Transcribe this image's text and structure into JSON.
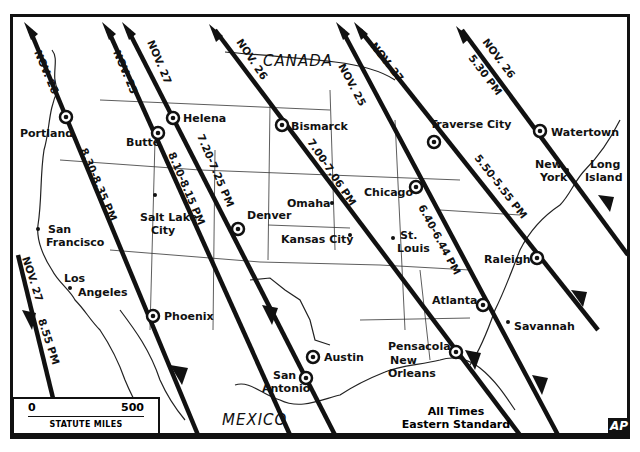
{
  "map": {
    "regions": {
      "canada": "CANADA",
      "mexico": "MEXICO"
    },
    "paths": [
      {
        "id": "nov26-west",
        "date_label": "NOV. 26",
        "time_label": "8.30-8.35 PM",
        "cities": [
          "Portland",
          "Phoenix"
        ]
      },
      {
        "id": "nov25-west",
        "date_label": "NOV. 25",
        "time_label": "8.10-8.15 PM",
        "cities": [
          "Butte",
          "San Antonio"
        ]
      },
      {
        "id": "nov27-west",
        "date_label": "NOV. 27",
        "time_label": "7.20-7.25 PM",
        "cities": [
          "Helena",
          "Denver",
          "Austin"
        ]
      },
      {
        "id": "nov26-central",
        "date_label": "NOV. 26",
        "time_label": "7.00-7.06 PM",
        "cities": [
          "Bismarck",
          "Pensacola"
        ]
      },
      {
        "id": "nov25-east",
        "date_label": "NOV. 25",
        "time_label": "6.40-6.44 PM",
        "cities": [
          "Chicago",
          "Atlanta"
        ]
      },
      {
        "id": "nov27-east",
        "date_label": "NOV. 27",
        "time_label": "5.50-5.55 PM",
        "cities": [
          "Traverse City",
          "Raleigh"
        ]
      },
      {
        "id": "nov26-east",
        "date_label": "NOV. 26",
        "time_label": "5.30 PM",
        "cities": [
          "Watertown"
        ]
      },
      {
        "id": "nov27-pacific",
        "date_label": "NOV. 27",
        "time_label": "8.55 PM",
        "cities": []
      }
    ],
    "path_cities": {
      "portland": "Portland",
      "butte": "Butte",
      "helena": "Helena",
      "bismarck": "Bismarck",
      "traverse_city": "Traverse City",
      "watertown": "Watertown",
      "chicago": "Chicago",
      "denver": "Denver",
      "raleigh": "Raleigh",
      "phoenix": "Phoenix",
      "atlanta": "Atlanta",
      "pensacola": "Pensacola",
      "austin": "Austin",
      "san_antonio_1": "San",
      "san_antonio_2": "Antonio"
    },
    "other_cities": {
      "salt_lake_1": "Salt Lake",
      "salt_lake_2": "City",
      "san_francisco_1": "San",
      "san_francisco_2": "Francisco",
      "los_angeles_1": "Los",
      "los_angeles_2": "Angeles",
      "omaha": "Omaha",
      "kansas_city": "Kansas City",
      "st_louis_1": "St.",
      "st_louis_2": "Louis",
      "new_york_1": "New",
      "new_york_2": "York",
      "long_island_1": "Long",
      "long_island_2": "Island",
      "new_orleans_1": "New",
      "new_orleans_2": "Orleans",
      "savannah": "Savannah"
    },
    "scale": {
      "zero": "0",
      "max": "500",
      "unit_label": "STATUTE MILES"
    },
    "note": {
      "line1": "All Times",
      "line2": "Eastern Standard"
    },
    "credit": "AP"
  }
}
